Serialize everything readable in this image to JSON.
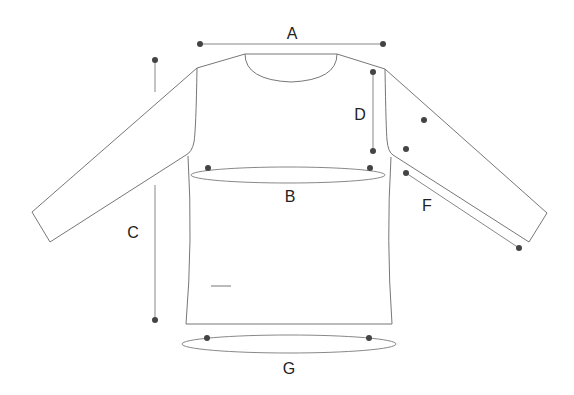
{
  "diagram": {
    "labels": {
      "A": "A",
      "B": "B",
      "C": "C",
      "D": "D",
      "F": "F",
      "G": "G"
    },
    "measurements": [
      {
        "key": "A",
        "meaning": "shoulder width"
      },
      {
        "key": "B",
        "meaning": "chest circumference"
      },
      {
        "key": "C",
        "meaning": "body length"
      },
      {
        "key": "D",
        "meaning": "armhole depth"
      },
      {
        "key": "F",
        "meaning": "sleeve length"
      },
      {
        "key": "G",
        "meaning": "hem circumference"
      }
    ],
    "colors": {
      "outline": "#777777",
      "measure_line": "#888888",
      "dot": "#444444",
      "text": "#222222"
    }
  }
}
